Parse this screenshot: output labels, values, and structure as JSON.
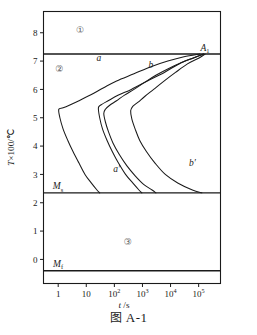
{
  "figure": {
    "caption_cn": "图",
    "caption_id": "A-1",
    "caption_full": "图 A-1"
  },
  "axes": {
    "y_label": "T×100/℃",
    "y_label_var": "T",
    "y_label_rest": "×100/℃",
    "x_label": "t /s",
    "x_label_var": "t",
    "x_label_rest": "/s",
    "y_ticks": [
      "0",
      "1",
      "2",
      "3",
      "4",
      "5",
      "6",
      "7",
      "8"
    ],
    "x_ticks": [
      "1",
      "10",
      "10²",
      "10³",
      "10⁴",
      "10⁵"
    ],
    "x_tick_bases": [
      "1",
      "10",
      "10",
      "10",
      "10",
      "10"
    ],
    "x_tick_exps": [
      "",
      "",
      "2",
      "3",
      "4",
      "5"
    ],
    "frame_color": "#1a1a1a"
  },
  "annotations": {
    "a1_line_label": "A",
    "a1_line_sub": "1",
    "ms_line_label": "M",
    "ms_line_sub": "s",
    "mf_line_label": "M",
    "mf_line_sub": "f",
    "curve_a": "a",
    "curve_b": "b",
    "curve_a_prime": "a′",
    "curve_b_prime": "b′",
    "region_1": "①",
    "region_2": "②",
    "region_3": "③"
  },
  "chart_data": {
    "type": "line",
    "title": "图 A-1",
    "xlabel": "t /s",
    "ylabel": "T×100/℃",
    "xscale": "log",
    "xlim": [
      0.3,
      600000
    ],
    "ylim": [
      -0.85,
      8.75
    ],
    "grid": false,
    "legend": "none",
    "tick_labels_x": [
      "1",
      "10",
      "10^2",
      "10^3",
      "10^4",
      "10^5"
    ],
    "tick_values_x": [
      1,
      10,
      100,
      1000,
      10000,
      100000
    ],
    "tick_labels_y": [
      "0",
      "1",
      "2",
      "3",
      "4",
      "5",
      "6",
      "7",
      "8"
    ],
    "tick_values_y": [
      0,
      1,
      2,
      3,
      4,
      5,
      6,
      7,
      8
    ],
    "horizontal_lines": [
      {
        "name": "A1",
        "label": "A₁",
        "y": 7.25
      },
      {
        "name": "Ms",
        "label": "Mₛ",
        "y": 2.35
      },
      {
        "name": "Mf",
        "label": "Mᶠ",
        "y": -0.4
      }
    ],
    "regions": [
      {
        "label": "①",
        "x": 6,
        "y": 8.0
      },
      {
        "label": "②",
        "x": 1.1,
        "y": 6.6
      },
      {
        "label": "③",
        "x": 300,
        "y": 0.5
      }
    ],
    "series": [
      {
        "name": "a",
        "label": "a",
        "label_x": 28,
        "label_y": 7.0,
        "points": [
          [
            110000,
            7.25
          ],
          [
            30000,
            7.15
          ],
          [
            8000,
            7.0
          ],
          [
            2000,
            6.8
          ],
          [
            500,
            6.55
          ],
          [
            120,
            6.3
          ],
          [
            40,
            6.05
          ],
          [
            14,
            5.8
          ],
          [
            5.5,
            5.6
          ],
          [
            2.6,
            5.45
          ],
          [
            1.5,
            5.35
          ],
          [
            1.05,
            5.3
          ],
          [
            1.15,
            5.0
          ],
          [
            1.5,
            4.6
          ],
          [
            2.2,
            4.2
          ],
          [
            3.4,
            3.8
          ],
          [
            5.5,
            3.4
          ],
          [
            9.0,
            3.0
          ],
          [
            15,
            2.7
          ],
          [
            24,
            2.45
          ],
          [
            30,
            2.35
          ]
        ]
      },
      {
        "name": "a_prime",
        "label": "a′",
        "label_x": 120,
        "label_y": 3.1,
        "points": [
          [
            150000,
            7.25
          ],
          [
            60000,
            7.1
          ],
          [
            20000,
            6.9
          ],
          [
            6000,
            6.6
          ],
          [
            1500,
            6.3
          ],
          [
            400,
            6.0
          ],
          [
            140,
            5.8
          ],
          [
            60,
            5.6
          ],
          [
            33,
            5.45
          ],
          [
            27,
            5.35
          ],
          [
            30,
            5.0
          ],
          [
            38,
            4.6
          ],
          [
            55,
            4.2
          ],
          [
            85,
            3.8
          ],
          [
            140,
            3.4
          ],
          [
            250,
            3.0
          ],
          [
            450,
            2.7
          ],
          [
            750,
            2.45
          ],
          [
            950,
            2.35
          ]
        ]
      },
      {
        "name": "b",
        "label": "b",
        "label_x": 2000,
        "label_y": 6.75,
        "points": [
          [
            150000,
            7.25
          ],
          [
            70000,
            7.12
          ],
          [
            25000,
            6.95
          ],
          [
            9000,
            6.75
          ],
          [
            3000,
            6.5
          ],
          [
            1200,
            6.25
          ],
          [
            500,
            6.0
          ],
          [
            230,
            5.8
          ],
          [
            120,
            5.6
          ],
          [
            70,
            5.45
          ],
          [
            48,
            5.3
          ],
          [
            42,
            5.15
          ],
          [
            48,
            4.85
          ],
          [
            62,
            4.5
          ],
          [
            90,
            4.1
          ],
          [
            150,
            3.7
          ],
          [
            280,
            3.3
          ],
          [
            550,
            2.95
          ],
          [
            1100,
            2.65
          ],
          [
            2200,
            2.45
          ],
          [
            3000,
            2.35
          ]
        ]
      },
      {
        "name": "b_prime",
        "label": "b′",
        "label_x": 60000,
        "label_y": 3.3,
        "points": [
          [
            170000,
            7.25
          ],
          [
            100000,
            7.1
          ],
          [
            40000,
            6.9
          ],
          [
            15000,
            6.6
          ],
          [
            6000,
            6.3
          ],
          [
            2500,
            6.0
          ],
          [
            1200,
            5.75
          ],
          [
            700,
            5.55
          ],
          [
            450,
            5.4
          ],
          [
            380,
            5.25
          ],
          [
            420,
            4.95
          ],
          [
            550,
            4.6
          ],
          [
            800,
            4.2
          ],
          [
            1400,
            3.8
          ],
          [
            2800,
            3.4
          ],
          [
            6500,
            3.0
          ],
          [
            18000,
            2.7
          ],
          [
            60000,
            2.45
          ],
          [
            130000,
            2.35
          ]
        ]
      }
    ]
  }
}
